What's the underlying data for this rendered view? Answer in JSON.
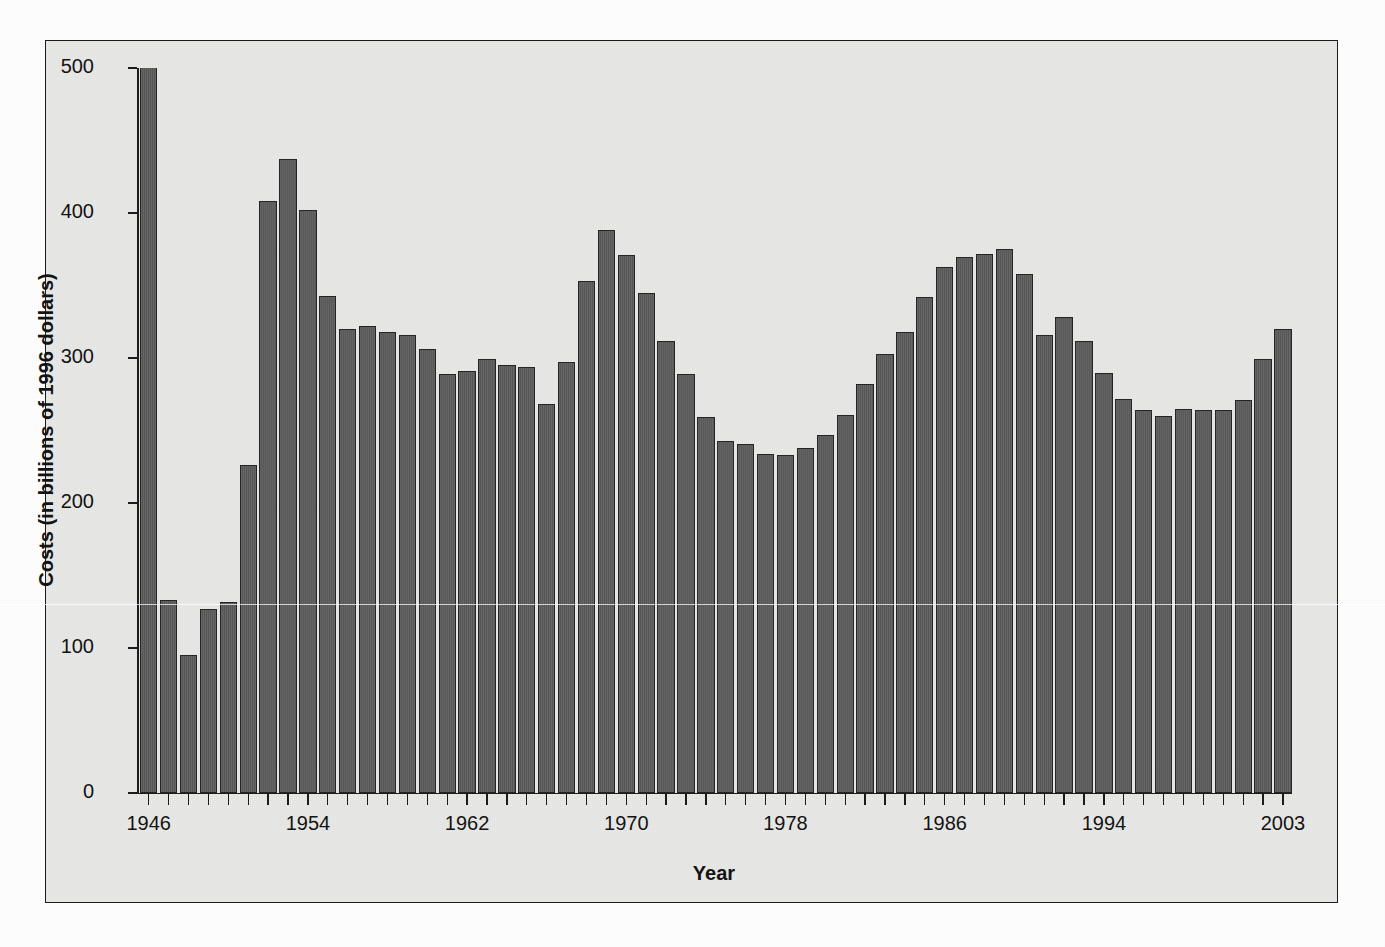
{
  "figure": {
    "background_color": "#ffffff",
    "panel_color": "#e8e8e6",
    "frame_color": "#1a1a1a",
    "bar_fill_color": "#5c5c5c",
    "bar_edge_color": "#232323"
  },
  "axes": {
    "ylabel": "Costs (in billions of 1996 dollars)",
    "xlabel": "Year",
    "ytick_labels": [
      "500",
      "400",
      "300",
      "200",
      "100",
      "0"
    ],
    "ytick_values": [
      500,
      400,
      300,
      200,
      100,
      0
    ],
    "xtick_labels": [
      "1946",
      "1954",
      "1962",
      "1970",
      "1978",
      "1986",
      "1994",
      "2003"
    ],
    "xtick_values": [
      1946,
      1954,
      1962,
      1970,
      1978,
      1986,
      1994,
      2003
    ],
    "ylim": [
      0,
      500
    ],
    "xlim": [
      1946,
      2003
    ],
    "grid": "off",
    "legend": "none"
  },
  "chart_data": {
    "type": "bar",
    "title": "",
    "subtitle": "",
    "xlabel": "Year",
    "ylabel": "Costs (in billions of 1996 dollars)",
    "ylim": [
      0,
      500
    ],
    "grid": false,
    "legend_position": "none",
    "note": "First bar (1946) is clipped by the top of the axis at 500.",
    "categories": [
      1946,
      1947,
      1948,
      1949,
      1950,
      1951,
      1952,
      1953,
      1954,
      1955,
      1956,
      1957,
      1958,
      1959,
      1960,
      1961,
      1962,
      1963,
      1964,
      1965,
      1966,
      1967,
      1968,
      1969,
      1970,
      1971,
      1972,
      1973,
      1974,
      1975,
      1976,
      1977,
      1978,
      1979,
      1980,
      1981,
      1982,
      1983,
      1984,
      1985,
      1986,
      1987,
      1988,
      1989,
      1990,
      1991,
      1992,
      1993,
      1994,
      1995,
      1996,
      1997,
      1998,
      1999,
      2000,
      2001,
      2002,
      2003
    ],
    "values": [
      520,
      133,
      95,
      127,
      132,
      226,
      408,
      437,
      402,
      343,
      320,
      322,
      318,
      316,
      306,
      289,
      291,
      299,
      295,
      294,
      268,
      297,
      353,
      388,
      371,
      345,
      312,
      289,
      259,
      243,
      241,
      234,
      233,
      238,
      247,
      261,
      282,
      303,
      318,
      342,
      363,
      370,
      372,
      375,
      358,
      316,
      328,
      312,
      290,
      272,
      264,
      260,
      265,
      264,
      264,
      271,
      299,
      320
    ],
    "clipped_indices": [
      0
    ]
  }
}
